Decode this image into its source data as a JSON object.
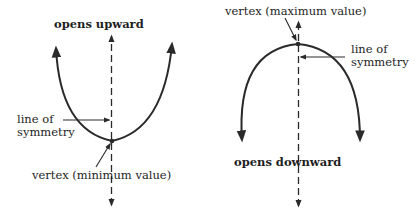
{
  "diagram": {
    "left": {
      "title": "opens upward",
      "axis_label_line1": "line of",
      "axis_label_line2": "symmetry",
      "vertex_label": "vertex (minimum value)"
    },
    "right": {
      "title": "opens downward",
      "axis_label_line1": "line of",
      "axis_label_line2": "symmetry",
      "vertex_label": "vertex (maximum value)"
    },
    "colors": {
      "ink": "#2a2a2a",
      "background": "#ffffff"
    }
  }
}
